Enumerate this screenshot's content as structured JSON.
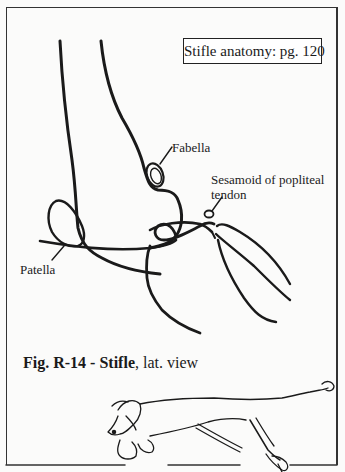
{
  "figure": {
    "reference_box": "Stifle anatomy: pg. 120",
    "labels": {
      "fabella": "Fabella",
      "sesamoid_line1": "Sesamoid of popliteal",
      "sesamoid_line2": "tendon",
      "patella": "Patella"
    },
    "caption": {
      "bold_part": "Fig. R-14 - Stifle",
      "normal_part": ", lat. view"
    },
    "illustration": {
      "subject": "stifle joint, lateral view (femur, patella, fabella, tibia, fibula)",
      "inset": "running dog with hind limb highlighted"
    },
    "colors": {
      "ink": "#1a1a1a",
      "paper": "#fbfbfa",
      "frame": "#333333"
    }
  }
}
